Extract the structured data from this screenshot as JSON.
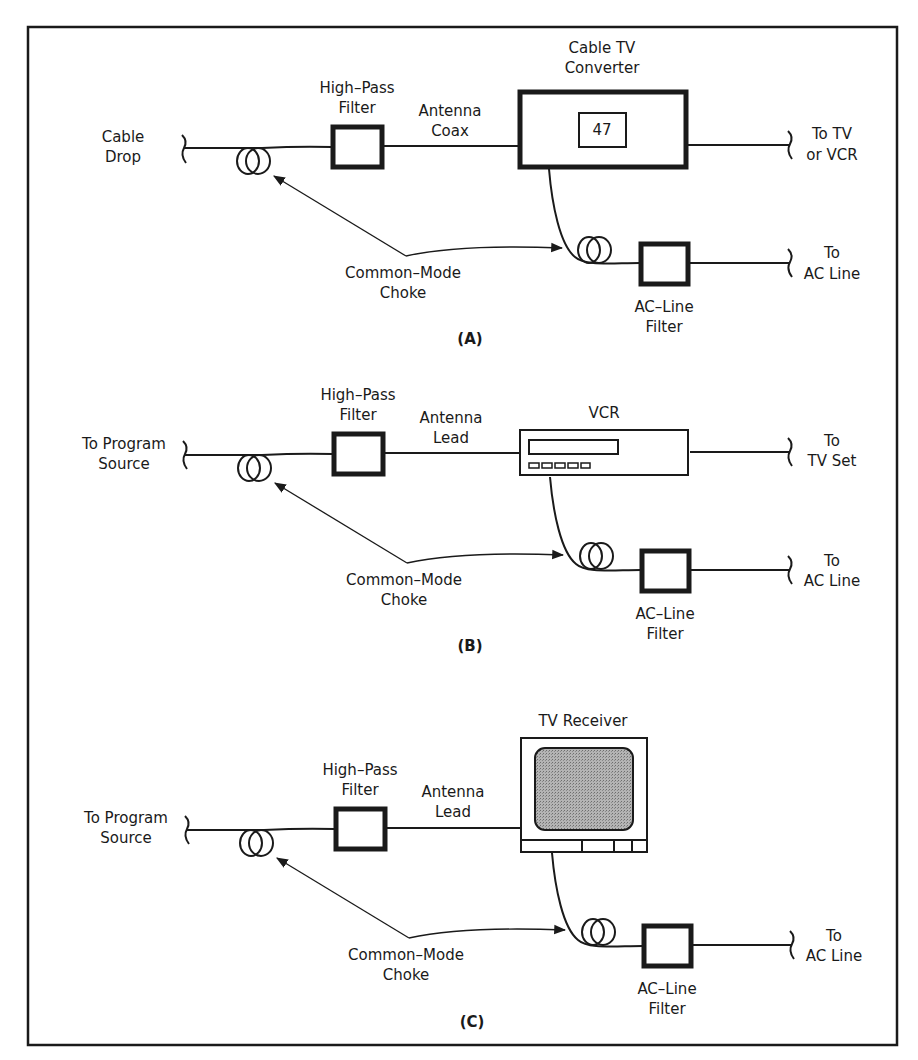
{
  "figure": {
    "border_color": "#1a1a1a",
    "screen_fill": "#9a9a9a",
    "panels": [
      {
        "id": "A",
        "caption": "(A)",
        "source_label": [
          "Cable",
          "Drop"
        ],
        "highpass_label": [
          "High–Pass",
          "Filter"
        ],
        "link_label": [
          "Antenna",
          "Coax"
        ],
        "device_label": [
          "Cable TV",
          "Converter"
        ],
        "device_display": "47",
        "output_label": [
          "To TV",
          "or VCR"
        ],
        "choke_label": [
          "Common–Mode",
          "Choke"
        ],
        "acfilter_label": [
          "AC–Line",
          "Filter"
        ],
        "ac_label": [
          "To",
          "AC Line"
        ]
      },
      {
        "id": "B",
        "caption": "(B)",
        "source_label": [
          "To Program",
          "Source"
        ],
        "highpass_label": [
          "High–Pass",
          "Filter"
        ],
        "link_label": [
          "Antenna",
          "Lead"
        ],
        "device_label": [
          "VCR"
        ],
        "output_label": [
          "To",
          "TV Set"
        ],
        "choke_label": [
          "Common–Mode",
          "Choke"
        ],
        "acfilter_label": [
          "AC–Line",
          "Filter"
        ],
        "ac_label": [
          "To",
          "AC Line"
        ]
      },
      {
        "id": "C",
        "caption": "(C)",
        "source_label": [
          "To Program",
          "Source"
        ],
        "highpass_label": [
          "High–Pass",
          "Filter"
        ],
        "link_label": [
          "Antenna",
          "Lead"
        ],
        "device_label": [
          "TV Receiver"
        ],
        "choke_label": [
          "Common–Mode",
          "Choke"
        ],
        "acfilter_label": [
          "AC–Line",
          "Filter"
        ],
        "ac_label": [
          "To",
          "AC Line"
        ]
      }
    ]
  }
}
